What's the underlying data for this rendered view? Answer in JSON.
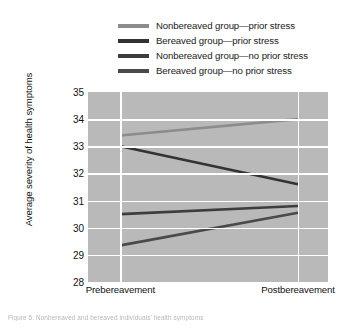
{
  "chart_data": {
    "type": "line",
    "title": "",
    "xlabel": "",
    "ylabel": "Average severity of health symptoms",
    "categories": [
      "Prebereavement",
      "Postbereavement"
    ],
    "ylim": [
      28,
      35
    ],
    "yticks": [
      28,
      29,
      30,
      31,
      32,
      33,
      34,
      35
    ],
    "grid": true,
    "legend_position": "top",
    "series": [
      {
        "name": "Nonbereaved group—prior stress",
        "values": [
          33.4,
          34.0
        ],
        "color": "#8c8c8c"
      },
      {
        "name": "Bereaved group—prior stress",
        "values": [
          33.0,
          31.6
        ],
        "color": "#333333"
      },
      {
        "name": "Nonbereaved group—no prior stress",
        "values": [
          30.5,
          30.8
        ],
        "color": "#3d3d3d"
      },
      {
        "name": "Bereaved group—no prior stress",
        "values": [
          29.35,
          30.55
        ],
        "color": "#4a4a4a"
      }
    ]
  },
  "figure": {
    "plot_background": "#b9b9b9",
    "gridline_color": "#ffffff",
    "caption": "Figure 5. Nonbereaved and bereaved individuals' health symptoms"
  }
}
